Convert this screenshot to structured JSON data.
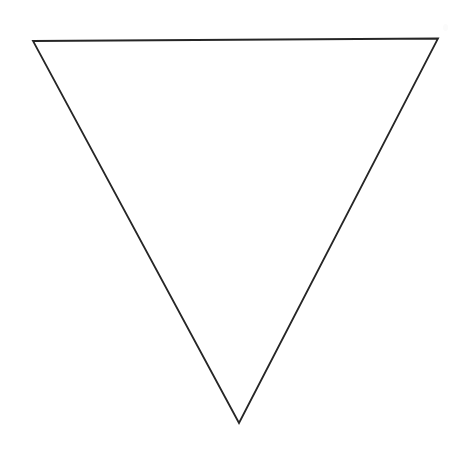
{
  "canvas": {
    "width": 469,
    "height": 464,
    "background_color": "#ffffff",
    "title": "Inverted triangle outline"
  },
  "figure": {
    "name": "inverted-triangle",
    "shape_type": "triangle",
    "orientation": "point-down",
    "fill": "none",
    "stroke_color": "#262626",
    "stroke_width": 1.8,
    "vertices": [
      {
        "label": "top-left",
        "x": 33,
        "y": 41
      },
      {
        "label": "top-right",
        "x": 438,
        "y": 38.5
      },
      {
        "label": "bottom-apex",
        "x": 239,
        "y": 423
      }
    ],
    "points_string": "33,41 438,38.5 239,423",
    "edges": [
      {
        "label": "top-edge",
        "from": "top-left",
        "to": "top-right"
      },
      {
        "label": "right-edge",
        "from": "top-right",
        "to": "bottom-apex"
      },
      {
        "label": "left-edge",
        "from": "bottom-apex",
        "to": "top-left"
      }
    ]
  }
}
